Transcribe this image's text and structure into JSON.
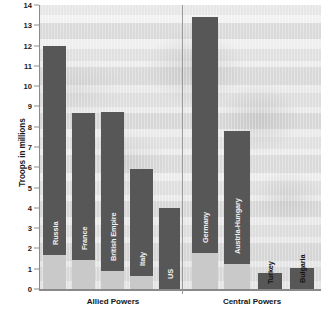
{
  "chart_data": {
    "type": "bar",
    "title": "",
    "subtitle": "",
    "xlabel": "",
    "ylabel": "Troops in millions",
    "ylim": [
      0,
      14
    ],
    "ytick_labels": [
      "0",
      "1",
      "2",
      "3",
      "4",
      "5",
      "6",
      "7",
      "8",
      "9",
      "10",
      "11",
      "12",
      "13",
      "14"
    ],
    "ytick_values": [
      0,
      1,
      2,
      3,
      4,
      5,
      6,
      7,
      8,
      9,
      10,
      11,
      12,
      13,
      14
    ],
    "grid": false,
    "legend_position": "none",
    "categories": [
      "Russia",
      "France",
      "British Empire",
      "Italy",
      "US",
      "Germany",
      "Austria-Hungary",
      "Turkey",
      "Bulgaria"
    ],
    "values": [
      12.0,
      8.7,
      8.75,
      5.9,
      4.0,
      13.4,
      7.8,
      0.8,
      1.05
    ],
    "series": [
      {
        "name": "Total troops mobilized",
        "values": [
          12.0,
          8.7,
          8.75,
          5.9,
          4.0,
          13.4,
          7.8,
          0.8,
          1.05
        ]
      },
      {
        "name": "Casualties / base segment",
        "values": [
          1.7,
          1.45,
          0.9,
          0.65,
          0.0,
          1.8,
          1.25,
          0.0,
          0.0
        ]
      }
    ],
    "groups": [
      {
        "label": "Allied Powers",
        "categories": [
          "Russia",
          "France",
          "British Empire",
          "Italy",
          "US"
        ]
      },
      {
        "label": "Central Powers",
        "categories": [
          "Germany",
          "Austria-Hungary",
          "Turkey",
          "Bulgaria"
        ]
      }
    ],
    "colors": {
      "bar_dark": "#575757",
      "bar_light": "#c9c9c9",
      "axis": "#8a8a8a",
      "text": "#141414",
      "plot_background": "#ececec"
    }
  },
  "axis": {
    "y_title": "Troops in millions"
  },
  "bars": [
    {
      "name": "Russia",
      "label": "Russia",
      "total": 12.0,
      "base": 1.7,
      "x": 43,
      "w": 23,
      "label_on_dark": true
    },
    {
      "name": "France",
      "label": "France",
      "total": 8.7,
      "base": 1.45,
      "x": 72,
      "w": 23,
      "label_on_dark": true
    },
    {
      "name": "British Empire",
      "label": "British Empire",
      "total": 8.75,
      "base": 0.9,
      "x": 101,
      "w": 23,
      "label_on_dark": true
    },
    {
      "name": "Italy",
      "label": "Italy",
      "total": 5.9,
      "base": 0.65,
      "x": 130,
      "w": 23,
      "label_on_dark": true
    },
    {
      "name": "US",
      "label": "US",
      "total": 4.0,
      "base": 0.0,
      "x": 159,
      "w": 21,
      "label_on_dark": true
    },
    {
      "name": "Germany",
      "label": "Germany",
      "total": 13.4,
      "base": 1.8,
      "x": 192,
      "w": 26,
      "label_on_dark": true
    },
    {
      "name": "Austria-Hungary",
      "label": "Austria-Hungary",
      "total": 7.8,
      "base": 1.25,
      "x": 224,
      "w": 26,
      "label_on_dark": true
    },
    {
      "name": "Turkey",
      "label": "Turkey",
      "total": 0.8,
      "base": 0.0,
      "x": 258,
      "w": 24,
      "label_on_dark": false
    },
    {
      "name": "Bulgaria",
      "label": "Bulgaria",
      "total": 1.05,
      "base": 0.0,
      "x": 290,
      "w": 24,
      "label_on_dark": false
    }
  ],
  "groups": [
    {
      "name": "allied-powers",
      "label": "Allied Powers",
      "center_x": 113
    },
    {
      "name": "central-powers",
      "label": "Central Powers",
      "center_x": 252
    }
  ]
}
